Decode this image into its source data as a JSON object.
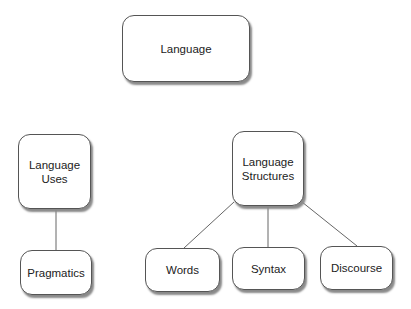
{
  "diagram": {
    "nodes": [
      {
        "id": "language",
        "label": "Language"
      },
      {
        "id": "language_uses",
        "label": "Language\nUses"
      },
      {
        "id": "language_structures",
        "label": "Language\nStructures"
      },
      {
        "id": "pragmatics",
        "label": "Pragmatics"
      },
      {
        "id": "words",
        "label": "Words"
      },
      {
        "id": "syntax",
        "label": "Syntax"
      },
      {
        "id": "discourse",
        "label": "Discourse"
      }
    ],
    "edges": [
      {
        "from": "language_uses",
        "to": "pragmatics"
      },
      {
        "from": "language_structures",
        "to": "words"
      },
      {
        "from": "language_structures",
        "to": "syntax"
      },
      {
        "from": "language_structures",
        "to": "discourse"
      }
    ],
    "colors": {
      "border": "#555555",
      "shadow": "#8a8a8a",
      "line": "#666666"
    }
  }
}
